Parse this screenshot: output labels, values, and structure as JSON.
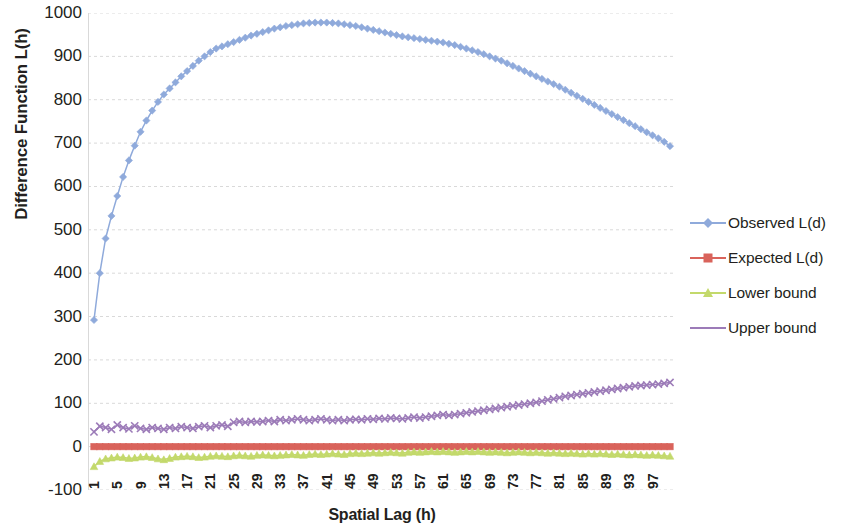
{
  "chart_data": {
    "type": "line",
    "title": "",
    "xlabel": "Spatial Lag (h)",
    "ylabel": "Difference Function L(h)",
    "xlim": [
      1,
      100
    ],
    "ylim": [
      -100,
      1000
    ],
    "ytick_labels": [
      "1000",
      "900",
      "800",
      "700",
      "600",
      "500",
      "400",
      "300",
      "200",
      "100",
      "0",
      "-100"
    ],
    "ytick_values": [
      1000,
      900,
      800,
      700,
      600,
      500,
      400,
      300,
      200,
      100,
      0,
      -100
    ],
    "xtick_labels": [
      "1",
      "5",
      "9",
      "13",
      "17",
      "21",
      "25",
      "29",
      "33",
      "37",
      "41",
      "45",
      "49",
      "53",
      "57",
      "61",
      "65",
      "69",
      "73",
      "77",
      "81",
      "85",
      "89",
      "93",
      "97"
    ],
    "xtick_values": [
      1,
      5,
      9,
      13,
      17,
      21,
      25,
      29,
      33,
      37,
      41,
      45,
      49,
      53,
      57,
      61,
      65,
      69,
      73,
      77,
      81,
      85,
      89,
      93,
      97
    ],
    "grid": "horizontal",
    "legend_position": "right",
    "x": [
      1,
      2,
      3,
      4,
      5,
      6,
      7,
      8,
      9,
      10,
      11,
      12,
      13,
      14,
      15,
      16,
      17,
      18,
      19,
      20,
      21,
      22,
      23,
      24,
      25,
      26,
      27,
      28,
      29,
      30,
      31,
      32,
      33,
      34,
      35,
      36,
      37,
      38,
      39,
      40,
      41,
      42,
      43,
      44,
      45,
      46,
      47,
      48,
      49,
      50,
      51,
      52,
      53,
      54,
      55,
      56,
      57,
      58,
      59,
      60,
      61,
      62,
      63,
      64,
      65,
      66,
      67,
      68,
      69,
      70,
      71,
      72,
      73,
      74,
      75,
      76,
      77,
      78,
      79,
      80,
      81,
      82,
      83,
      84,
      85,
      86,
      87,
      88,
      89,
      90,
      91,
      92,
      93,
      94,
      95,
      96,
      97,
      98,
      99,
      100
    ],
    "series": [
      {
        "name": "Observed L(d)",
        "color": "#8FAADB",
        "marker": "diamond",
        "values": [
          292,
          400,
          480,
          532,
          578,
          622,
          660,
          694,
          726,
          752,
          775,
          795,
          812,
          826,
          840,
          854,
          866,
          878,
          890,
          900,
          910,
          918,
          923,
          928,
          933,
          938,
          943,
          948,
          952,
          956,
          960,
          964,
          967,
          970,
          972,
          974,
          976,
          977,
          978,
          978,
          978,
          977,
          976,
          974,
          972,
          970,
          967,
          964,
          961,
          958,
          955,
          952,
          949,
          946,
          944,
          942,
          940,
          938,
          936,
          934,
          932,
          929,
          926,
          922,
          918,
          914,
          910,
          905,
          900,
          895,
          890,
          884,
          878,
          872,
          866,
          860,
          854,
          848,
          842,
          836,
          830,
          823,
          816,
          809,
          802,
          795,
          788,
          781,
          774,
          767,
          760,
          753,
          746,
          739,
          732,
          725,
          718,
          711,
          703,
          693
        ]
      },
      {
        "name": "Expected L(d)",
        "color": "#D9635B",
        "marker": "square",
        "values": [
          0,
          0,
          0,
          0,
          0,
          0,
          0,
          0,
          0,
          0,
          0,
          0,
          0,
          0,
          0,
          0,
          0,
          0,
          0,
          0,
          0,
          0,
          0,
          0,
          0,
          0,
          0,
          0,
          0,
          0,
          0,
          0,
          0,
          0,
          0,
          0,
          0,
          0,
          0,
          0,
          0,
          0,
          0,
          0,
          0,
          0,
          0,
          0,
          0,
          0,
          0,
          0,
          0,
          0,
          0,
          0,
          0,
          0,
          0,
          0,
          0,
          0,
          0,
          0,
          0,
          0,
          0,
          0,
          0,
          0,
          0,
          0,
          0,
          0,
          0,
          0,
          0,
          0,
          0,
          0,
          0,
          0,
          0,
          0,
          0,
          0,
          0,
          0,
          0,
          0,
          0,
          0,
          0,
          0,
          0,
          0,
          0,
          0,
          0,
          0
        ]
      },
      {
        "name": "Lower bound",
        "color": "#C3D96B",
        "marker": "triangle",
        "values": [
          -46,
          -34,
          -28,
          -26,
          -24,
          -25,
          -27,
          -26,
          -24,
          -23,
          -25,
          -28,
          -30,
          -27,
          -24,
          -23,
          -22,
          -23,
          -25,
          -24,
          -22,
          -21,
          -22,
          -23,
          -21,
          -20,
          -21,
          -22,
          -20,
          -19,
          -20,
          -21,
          -20,
          -19,
          -18,
          -19,
          -20,
          -18,
          -17,
          -18,
          -17,
          -16,
          -17,
          -18,
          -16,
          -15,
          -16,
          -15,
          -14,
          -15,
          -14,
          -13,
          -14,
          -15,
          -13,
          -12,
          -13,
          -12,
          -11,
          -12,
          -11,
          -12,
          -13,
          -12,
          -11,
          -12,
          -11,
          -12,
          -13,
          -12,
          -13,
          -14,
          -13,
          -12,
          -13,
          -14,
          -13,
          -14,
          -15,
          -14,
          -15,
          -16,
          -15,
          -16,
          -17,
          -16,
          -17,
          -16,
          -17,
          -18,
          -17,
          -18,
          -19,
          -18,
          -19,
          -20,
          -19,
          -20,
          -21,
          -22
        ]
      },
      {
        "name": "Upper bound",
        "color": "#9C7BB8",
        "marker": "x",
        "values": [
          34,
          47,
          44,
          40,
          50,
          44,
          41,
          48,
          42,
          40,
          44,
          42,
          40,
          44,
          42,
          46,
          44,
          42,
          46,
          48,
          44,
          48,
          50,
          47,
          56,
          58,
          56,
          58,
          57,
          58,
          60,
          58,
          62,
          60,
          62,
          64,
          62,
          60,
          62,
          64,
          62,
          60,
          62,
          60,
          62,
          63,
          62,
          64,
          63,
          65,
          64,
          66,
          65,
          64,
          66,
          68,
          66,
          68,
          70,
          72,
          74,
          72,
          74,
          76,
          78,
          80,
          82,
          84,
          86,
          88,
          90,
          92,
          94,
          96,
          98,
          100,
          102,
          105,
          108,
          110,
          113,
          116,
          118,
          120,
          122,
          124,
          126,
          128,
          130,
          132,
          134,
          136,
          138,
          140,
          141,
          142,
          143,
          144,
          146,
          148
        ]
      }
    ]
  }
}
